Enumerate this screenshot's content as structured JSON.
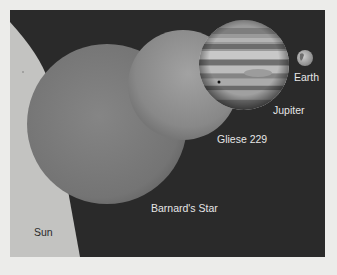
{
  "figure": {
    "type": "size-comparison-illustration",
    "colors": {
      "page_background": "#ececea",
      "space_background": "#2a2a2a",
      "sun": "#c3c3c1",
      "barnards_star": "#7b7b7b",
      "gliese_229": "#8e8e8e",
      "jupiter": "#9c9c9c",
      "earth": "#b5b5b5",
      "label_light": "#e6e6e6",
      "label_dark": "#2a2a2a"
    },
    "bodies": [
      {
        "name": "Sun",
        "label": "Sun"
      },
      {
        "name": "Barnard's Star",
        "label": "Barnard's Star"
      },
      {
        "name": "Gliese 229",
        "label": "Gliese 229"
      },
      {
        "name": "Jupiter",
        "label": "Jupiter"
      },
      {
        "name": "Earth",
        "label": "Earth"
      }
    ]
  }
}
